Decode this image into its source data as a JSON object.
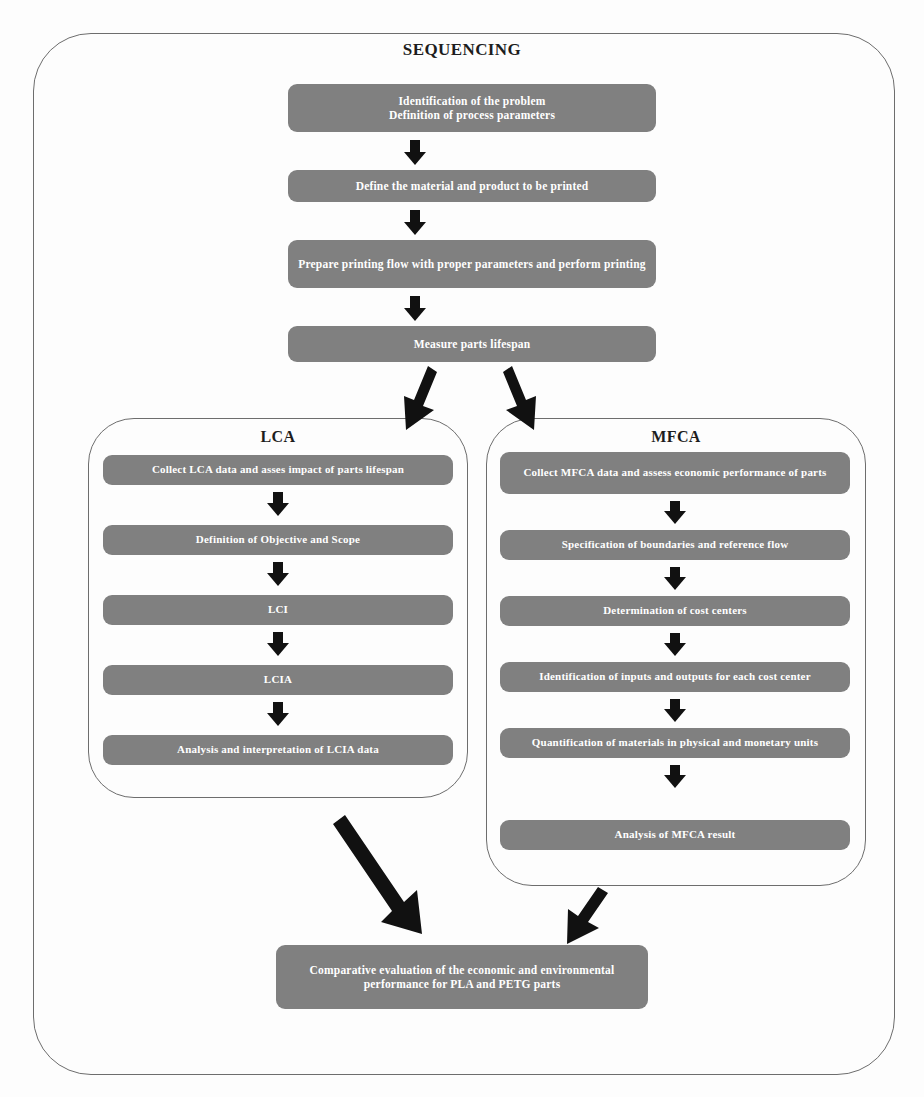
{
  "diagram": {
    "title_sequencing": "SEQUENCING",
    "title_lca": "LCA",
    "title_mfca": "MFCA",
    "colors": {
      "box_fill": "#808080",
      "box_text": "#ffffff",
      "container_border": "#6d6d6d",
      "arrow": "#111111",
      "background": "#fdfdfd"
    },
    "sequencing_steps": [
      {
        "id": "seq-1",
        "text": "Identification of the problem\nDefinition of process parameters"
      },
      {
        "id": "seq-2",
        "text": "Define the material and product to be printed"
      },
      {
        "id": "seq-3",
        "text": "Prepare printing flow with proper parameters and perform printing"
      },
      {
        "id": "seq-4",
        "text": "Measure parts lifespan"
      }
    ],
    "lca_steps": [
      {
        "id": "lca-1",
        "text": "Collect LCA data and asses impact of parts lifespan"
      },
      {
        "id": "lca-2",
        "text": "Definition of Objective and Scope"
      },
      {
        "id": "lca-3",
        "text": "LCI"
      },
      {
        "id": "lca-4",
        "text": "LCIA"
      },
      {
        "id": "lca-5",
        "text": "Analysis and interpretation of LCIA data"
      }
    ],
    "mfca_steps": [
      {
        "id": "mfca-1",
        "text": "Collect MFCA data and assess economic performance of parts"
      },
      {
        "id": "mfca-2",
        "text": "Specification of boundaries and reference flow"
      },
      {
        "id": "mfca-3",
        "text": "Determination of cost centers"
      },
      {
        "id": "mfca-4",
        "text": "Identification of inputs and outputs for each cost center"
      },
      {
        "id": "mfca-5",
        "text": "Quantification of materials in physical and monetary units"
      },
      {
        "id": "mfca-6",
        "text": "Analysis of MFCA result"
      }
    ],
    "final_step": {
      "id": "final-1",
      "text": "Comparative evaluation of the economic and environmental performance for PLA and PETG parts"
    },
    "arrows": {
      "seq_1_to_2": "down-arrow",
      "seq_2_to_3": "down-arrow",
      "seq_3_to_4": "down-arrow",
      "seq_to_lca": "diagonal-down-left-arrow",
      "seq_to_mfca": "diagonal-down-right-arrow",
      "lca_1_to_2": "down-arrow",
      "lca_2_to_3": "down-arrow",
      "lca_3_to_4": "down-arrow",
      "lca_4_to_5": "down-arrow",
      "mfca_1_to_2": "down-arrow",
      "mfca_2_to_3": "down-arrow",
      "mfca_3_to_4": "down-arrow",
      "mfca_4_to_5": "down-arrow",
      "mfca_5_to_6": "down-arrow",
      "lca_to_final": "long-diagonal-down-right-arrow",
      "mfca_to_final": "diagonal-down-left-arrow"
    }
  }
}
